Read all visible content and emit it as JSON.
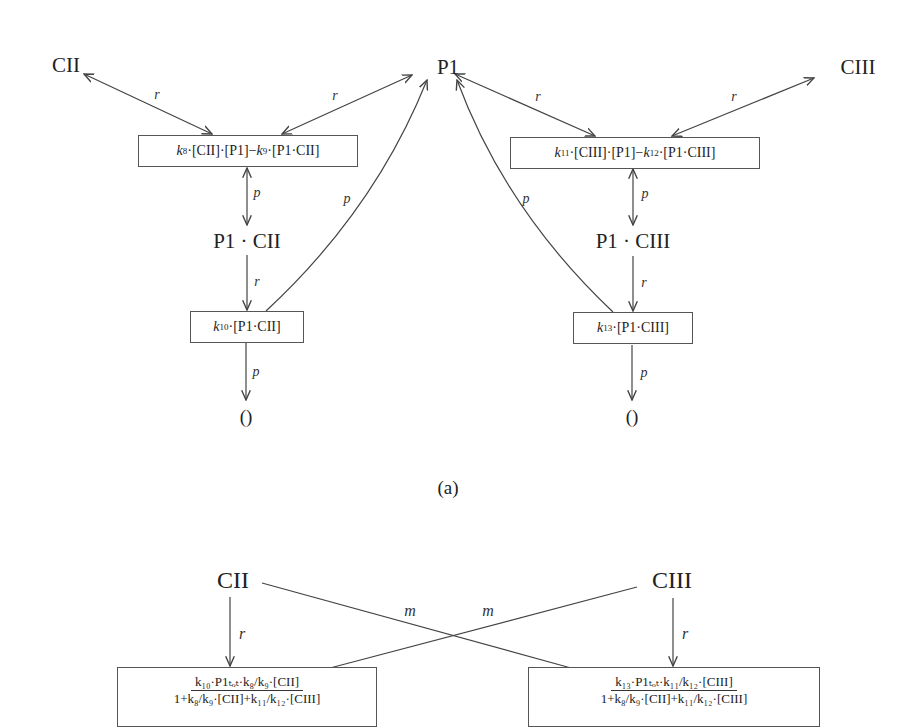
{
  "diagram_a": {
    "caption": "(a)",
    "species": {
      "cii": "CII",
      "p1": "P1",
      "ciii": "CIII",
      "p1_cii": "P1 · CII",
      "p1_ciii": "P1 · CIII",
      "sink_left": "()",
      "sink_right": "()"
    },
    "reactions": {
      "bind_cii": {
        "k1": "k",
        "k1_sub": "8",
        "mid1": "·[CII]·[P1]−",
        "k2": "k",
        "k2_sub": "9",
        "tail": "·[P1·CII]"
      },
      "bind_ciii": {
        "k1": "k",
        "k1_sub": "11",
        "mid1": "·[CIII]·[P1]−",
        "k2": "k",
        "k2_sub": "12",
        "tail": "·[P1·CIII]"
      },
      "deg_cii": {
        "k": "k",
        "k_sub": "10",
        "tail": "·[P1·CII]"
      },
      "deg_ciii": {
        "k": "k",
        "k_sub": "13",
        "tail": "·[P1·CIII]"
      }
    },
    "edge_labels": {
      "r": "r",
      "p": "p"
    }
  },
  "diagram_b": {
    "species": {
      "cii": "CII",
      "ciii": "CIII"
    },
    "edge_labels": {
      "r": "r",
      "m": "m"
    },
    "reactions": {
      "left": {
        "numerator": "k₁₀·P1ₜₒₜ·k₈/k₉·[CII]",
        "denominator": "1+k₈/k₉·[CII]+k₁₁/k₁₂·[CIII]"
      },
      "right": {
        "numerator": "k₁₃·P1ₜₒₜ·k₁₁/k₁₂·[CIII]",
        "denominator": "1+k₈/k₉·[CII]+k₁₁/k₁₂·[CIII]"
      }
    }
  }
}
